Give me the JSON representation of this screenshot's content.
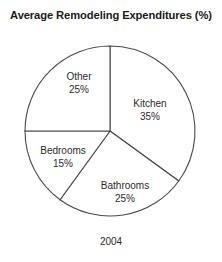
{
  "chart_data": {
    "type": "pie",
    "title": "Average Remodeling Expenditures (%)",
    "caption": "2004",
    "xlabel": "",
    "ylabel": "",
    "legend": "none",
    "grid": false,
    "units": "%",
    "start_angle_deg": 0,
    "direction": "clockwise",
    "categories": [
      "Kitchen",
      "Bathrooms",
      "Bedrooms",
      "Other"
    ],
    "values": [
      35,
      25,
      15,
      25
    ],
    "slices": [
      {
        "name": "Kitchen",
        "value": 35,
        "value_label": "35%",
        "start_deg": 0,
        "end_deg": 126,
        "fill": "#ffffff",
        "stroke": "#4a4a4a",
        "label_x": 150,
        "label_y": 110
      },
      {
        "name": "Bathrooms",
        "value": 25,
        "value_label": "25%",
        "start_deg": 126,
        "end_deg": 216,
        "fill": "#ffffff",
        "stroke": "#4a4a4a",
        "label_x": 125,
        "label_y": 192
      },
      {
        "name": "Bedrooms",
        "value": 15,
        "value_label": "15%",
        "start_deg": 216,
        "end_deg": 270,
        "fill": "#ffffff",
        "stroke": "#4a4a4a",
        "label_x": 63,
        "label_y": 157
      },
      {
        "name": "Other",
        "value": 25,
        "value_label": "25%",
        "start_deg": 270,
        "end_deg": 360,
        "fill": "#ffffff",
        "stroke": "#4a4a4a",
        "label_x": 79,
        "label_y": 83
      }
    ],
    "geometry": {
      "center_x": 110,
      "center_y": 131,
      "radius": 85
    },
    "colors": {
      "background": "#ffffff",
      "outline": "#4a4a4a",
      "text": "#2b2b2b",
      "title_text": "#1a1a1a"
    }
  }
}
